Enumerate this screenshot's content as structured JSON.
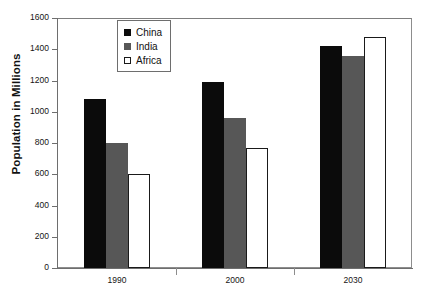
{
  "chart_data": {
    "type": "bar",
    "title": "",
    "xlabel": "",
    "ylabel": "Population in Millions",
    "categories": [
      "1990",
      "2000",
      "2030"
    ],
    "series": [
      {
        "name": "China",
        "color": "#0b0b0b",
        "values": [
          1080,
          1190,
          1420
        ]
      },
      {
        "name": "India",
        "color": "#575757",
        "values": [
          800,
          960,
          1360
        ]
      },
      {
        "name": "Africa",
        "color": "#ffffff",
        "values": [
          600,
          770,
          1480
        ]
      }
    ],
    "ylim": [
      0,
      1600
    ],
    "ytick_labels": [
      "0",
      "200",
      "400",
      "600",
      "800",
      "1000",
      "1200",
      "1400",
      "1600"
    ],
    "ytick_values": [
      0,
      200,
      400,
      600,
      800,
      1000,
      1200,
      1400,
      1600
    ],
    "grid": false,
    "legend_position": "top-center",
    "legend_entries": [
      "China",
      "India",
      "Africa"
    ]
  }
}
